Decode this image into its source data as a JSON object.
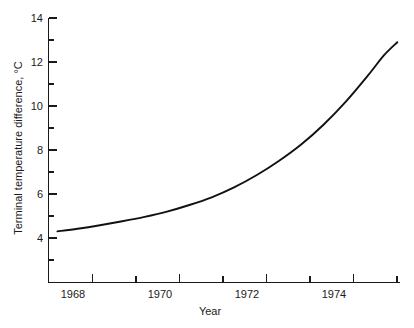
{
  "chart_data": {
    "type": "line",
    "title": "",
    "xlabel": "Year",
    "ylabel": "Terminal temperature difference, °C",
    "xlim": [
      1967.75,
      1975.6
    ],
    "ylim": [
      2.7,
      14
    ],
    "grid": false,
    "legend": false,
    "x_tick_labels": [
      "1968",
      "1970",
      "1972",
      "1974"
    ],
    "x_tick_values": [
      1968,
      1970,
      1972,
      1974
    ],
    "x_minor_tick_values": [
      1969,
      1971,
      1973,
      1975
    ],
    "y_tick_labels": [
      "4",
      "6",
      "8",
      "10",
      "12",
      "14"
    ],
    "y_tick_values": [
      4,
      6,
      8,
      10,
      12,
      14
    ],
    "y_minor_tick_values": [
      5,
      7,
      9,
      11,
      13
    ],
    "series": [
      {
        "name": "Terminal temperature difference",
        "x": [
          1967.95,
          1968.4,
          1968.9,
          1969.4,
          1969.9,
          1970.4,
          1970.9,
          1971.4,
          1971.9,
          1972.4,
          1972.9,
          1973.4,
          1973.9,
          1974.4,
          1974.9,
          1975.25,
          1975.55
        ],
        "values": [
          4.3,
          4.42,
          4.58,
          4.76,
          4.96,
          5.2,
          5.5,
          5.85,
          6.3,
          6.85,
          7.5,
          8.25,
          9.15,
          10.2,
          11.4,
          12.3,
          12.9
        ]
      }
    ],
    "annotations": []
  },
  "axis_labels": {
    "y_title": "Terminal temperature difference, °C",
    "x_title": "Year"
  },
  "colors": {
    "curve": "#111111",
    "axis": "#1a1a1a",
    "background": "#ffffff"
  }
}
